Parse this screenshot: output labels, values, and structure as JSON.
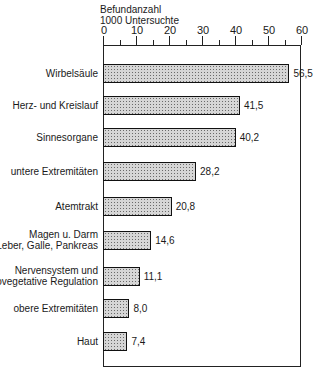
{
  "chart_data": {
    "type": "bar",
    "orientation": "horizontal",
    "title": "",
    "xlabel": "Befundanzahl 1000 Untersuchte",
    "ylabel": "",
    "xlim": [
      0,
      60
    ],
    "xticks": [
      0,
      10,
      20,
      30,
      40,
      50,
      60
    ],
    "grid": false,
    "legend": null,
    "categories": [
      "Wirbelsäule",
      "Herz- und Kreislauf",
      "Sinnesorgane",
      "untere Extremitäten",
      "Atemtrakt",
      "Magen u. Darm\nLeber, Galle, Pankreas",
      "Nervensystem und\npsychovegetative Regulation",
      "obere Extremitäten",
      "Haut"
    ],
    "values": [
      56.5,
      41.5,
      40.2,
      28.2,
      20.8,
      14.6,
      11.1,
      8.0,
      7.4
    ],
    "value_labels": [
      "56,5",
      "41,5",
      "40,2",
      "28,2",
      "20,8",
      "14,6",
      "11,1",
      "8,0",
      "7,4"
    ]
  },
  "axis": {
    "title_line1": "Befundanzahl",
    "title_line2": "1000 Untersuchte"
  }
}
